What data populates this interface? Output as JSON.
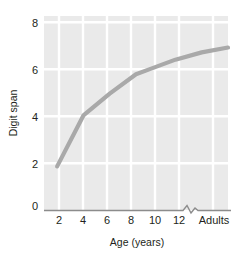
{
  "chart_data": {
    "type": "line",
    "title": "",
    "xlabel": "Age (years)",
    "ylabel": "Digit span",
    "x_tick_labels": [
      "2",
      "4",
      "6",
      "8",
      "10",
      "12",
      "Adults"
    ],
    "y_tick_labels": [
      "0",
      "2",
      "4",
      "6",
      "8"
    ],
    "ylim": [
      0,
      8
    ],
    "xlim": [
      1,
      15
    ],
    "grid": true,
    "legend": "none",
    "axis_break": {
      "present": true,
      "between": [
        "12",
        "Adults"
      ],
      "style": "zigzag"
    },
    "series": [
      {
        "name": "Digit span by age",
        "x": [
          2,
          4,
          6,
          8,
          9,
          11,
          13,
          15
        ],
        "x_labels": [
          "2",
          "4",
          "6",
          "8",
          "9",
          "11",
          "13",
          "Adults"
        ],
        "values": [
          1.8,
          3.9,
          4.8,
          5.6,
          5.8,
          6.2,
          6.5,
          6.7
        ],
        "color": "#a9a9a9"
      }
    ],
    "colors": {
      "plot_background": "#eaeaea",
      "gridline": "#ffffff",
      "axis": "#8c8c8c",
      "line": "#a9a9a9",
      "text": "#231f20"
    }
  }
}
